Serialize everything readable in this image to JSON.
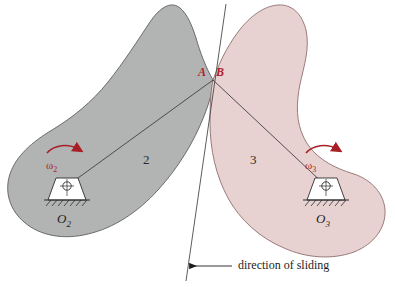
{
  "figure": {
    "type": "mechanism-diagram",
    "background_color": "#ffffff"
  },
  "colors": {
    "body2_fill": "#b2b4b3",
    "body2_stroke": "#5d5f5e",
    "body3_fill": "#e8d2d1",
    "body3_stroke": "#8d6e6c",
    "omega_red": "#a81f28",
    "point_red": "#b0202b",
    "line_dark": "#3a3a3a",
    "pivot_fill": "#ffffff"
  },
  "bodies": [
    {
      "id": "body-2",
      "label": "2",
      "fill": "#b2b4b3",
      "pivot_label": "O",
      "pivot_subscript": "2",
      "omega_label": "ω",
      "omega_subscript": "2",
      "rotation_sense": "clockwise"
    },
    {
      "id": "body-3",
      "label": "3",
      "fill": "#e8d2d1",
      "pivot_label": "O",
      "pivot_subscript": "3",
      "omega_label": "ω",
      "omega_subscript": "3",
      "rotation_sense": "clockwise"
    }
  ],
  "contact": {
    "point_a_label": "A",
    "point_b_label": "B",
    "description": "coincident contact points on bodies 2 and 3"
  },
  "annotations": {
    "sliding_caption": "direction of sliding",
    "tangent_line_name": "common tangent at contact"
  }
}
